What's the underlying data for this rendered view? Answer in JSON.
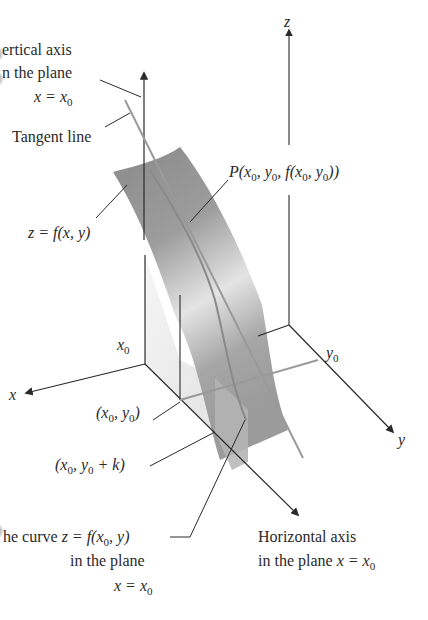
{
  "figure": {
    "axes": {
      "z_label": "z",
      "x_label": "x",
      "y_label": "y",
      "x0_label": "x",
      "x0_sub": "0",
      "y0_label": "y",
      "y0_sub": "0"
    },
    "labels": {
      "vertical_axis": {
        "line1": "Vertical axis",
        "line1_visible": "ertical axis",
        "line2": "in the plane",
        "line2_visible": "n the plane",
        "line3_var": "x = x",
        "line3_sub": "0"
      },
      "tangent_line": "Tangent line",
      "point_P": {
        "prefix": "P(",
        "x": "x",
        "x_sub": "0",
        "sep1": ", ",
        "y": "y",
        "y_sub": "0",
        "sep2": ", ",
        "f": "f(",
        "fx": "x",
        "fx_sub": "0",
        "sep3": ", ",
        "fy": "y",
        "fy_sub": "0",
        "suffix": "))"
      },
      "surface": "z = f(x, y)",
      "point_x0y0": {
        "open": "(",
        "x": "x",
        "x_sub": "0",
        "sep": ", ",
        "y": "y",
        "y_sub": "0",
        "close": ")"
      },
      "point_x0y0k": {
        "open": "(",
        "x": "x",
        "x_sub": "0",
        "sep": ", ",
        "y": "y",
        "y_sub": "0",
        "plus": " + k",
        "close": ")"
      },
      "curve": {
        "line1_prefix": "he curve ",
        "line1_full_prefix": "The curve ",
        "line1_eq": "z = f(x",
        "line1_sub": "0",
        "line1_end": ", y)",
        "line2": "in the plane",
        "line3_var": "x = x",
        "line3_sub": "0"
      },
      "horizontal_axis": {
        "line1": "Horizontal axis",
        "line2_text": "in the plane ",
        "line2_var": "x = x",
        "line2_sub": "0"
      }
    },
    "colors": {
      "ink": "#2a2a2a",
      "surface_dark": "#8c8c8c",
      "surface_light": "#e6e6e6",
      "plane_fill": "#cfcfcf",
      "tangent": "#9a9a9a"
    }
  }
}
